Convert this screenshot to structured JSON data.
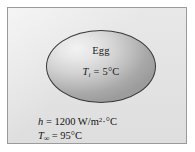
{
  "figure": {
    "panel": {
      "background_color": "#e4e4e4",
      "border_color": "#9a9a9a"
    },
    "body": {
      "name": "Egg",
      "initial_temperature_label": "T",
      "initial_temperature_subscript": "i",
      "initial_temperature_equals": " = ",
      "initial_temperature_value": "5",
      "initial_temperature_unit": "°C",
      "fill_color": "#d2d2d2",
      "outline_color": "#3a3a3a"
    },
    "annotations": {
      "h_symbol": "h",
      "h_equals": " = ",
      "h_value": "1200",
      "h_unit_main": " W/m",
      "h_unit_exponent": "2",
      "h_unit_tail": "·°C",
      "tinf_symbol": "T",
      "tinf_subscript": "∞",
      "tinf_equals": " = ",
      "tinf_value": "95",
      "tinf_unit": "°C"
    }
  }
}
